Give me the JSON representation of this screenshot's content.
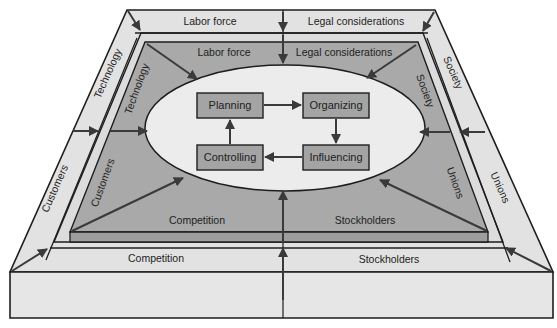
{
  "colors": {
    "outer_band": "#e2e2e2",
    "outer_front": "#e6e6e6",
    "inner_band": "#dcdcdc",
    "inner_panel": "#a9a9a9",
    "inner_strip": "#9d9d9d",
    "ellipse": "#ececec",
    "box": "#a4a4a4",
    "stroke": "#1e1e1e",
    "arrow": "#3a3a3a"
  },
  "outer_ring": {
    "top_left": "Labor force",
    "top_right": "Legal considerations",
    "left_upper": "Technology",
    "left_lower": "Customers",
    "right_upper": "Society",
    "right_lower": "Unions",
    "bottom_left": "Competition",
    "bottom_right": "Stockholders"
  },
  "inner_ring": {
    "top_left": "Labor force",
    "top_right": "Legal considerations",
    "left_upper": "Technology",
    "left_lower": "Customers",
    "right_upper": "Society",
    "right_lower": "Unions",
    "bottom_left": "Competition",
    "bottom_right": "Stockholders"
  },
  "management_cycle": {
    "planning": "Planning",
    "organizing": "Organizing",
    "influencing": "Influencing",
    "controlling": "Controlling"
  }
}
